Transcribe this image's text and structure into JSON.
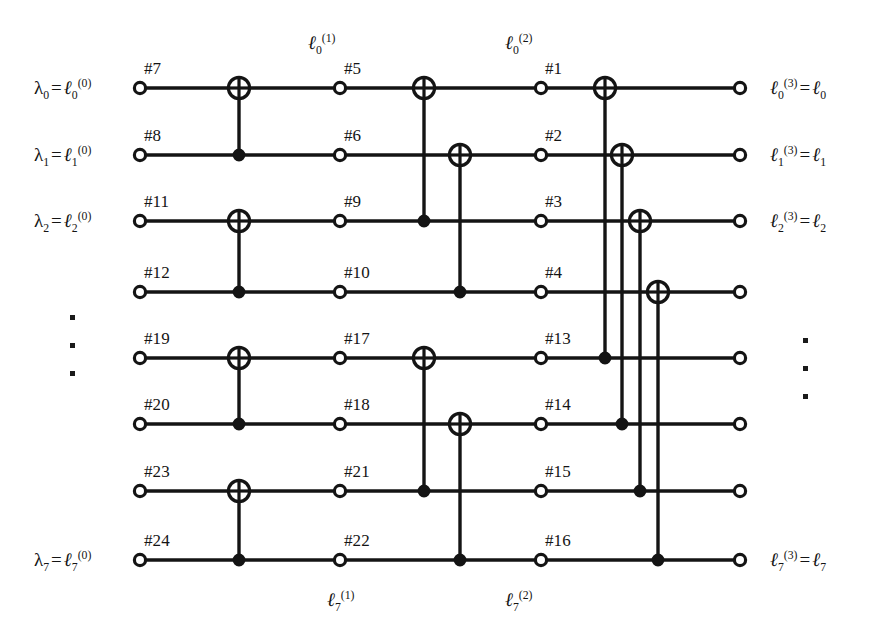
{
  "figure": {
    "width": 876,
    "height": 644,
    "background": "#ffffff",
    "ink": "#141414"
  },
  "geometry": {
    "rows_y": [
      88,
      155,
      221,
      292,
      358,
      424,
      491,
      560
    ],
    "col_x": {
      "input_node": 140,
      "stage1_gate": 239,
      "node_col2": 340,
      "stage2_gate_a": 424,
      "stage2_gate_b": 460,
      "node_col3": 541,
      "stage3_gates": [
        605,
        622,
        640,
        658
      ],
      "output_node": 740
    },
    "wire_start": 140,
    "wire_end": 740
  },
  "wires": [
    {
      "index": 0,
      "input_label": "λ₀ = ℓ₀⁽⁰⁾",
      "output_label": "ℓ₀⁽³⁾ = ℓ₀"
    },
    {
      "index": 1,
      "input_label": "λ₁ = ℓ₁⁽⁰⁾",
      "output_label": "ℓ₁⁽³⁾ = ℓ₁"
    },
    {
      "index": 2,
      "input_label": "λ₂ = ℓ₂⁽⁰⁾",
      "output_label": "ℓ₂⁽³⁾ = ℓ₂"
    },
    {
      "index": 3,
      "input_label": "",
      "output_label": ""
    },
    {
      "index": 4,
      "input_label": "",
      "output_label": ""
    },
    {
      "index": 5,
      "input_label": "",
      "output_label": ""
    },
    {
      "index": 6,
      "input_label": "",
      "output_label": ""
    },
    {
      "index": 7,
      "input_label": "λ₇ = ℓ₇⁽⁰⁾",
      "output_label": "ℓ₇⁽³⁾ = ℓ₇"
    }
  ],
  "node_labels": {
    "column_1": [
      "#7",
      "#8",
      "#11",
      "#12",
      "#19",
      "#20",
      "#23",
      "#24"
    ],
    "column_2": [
      "#5",
      "#6",
      "#9",
      "#10",
      "#17",
      "#18",
      "#21",
      "#22"
    ],
    "column_3": [
      "#1",
      "#2",
      "#3",
      "#4",
      "#13",
      "#14",
      "#15",
      "#16"
    ]
  },
  "stage_labels": {
    "top_stage1": {
      "base": "ℓ",
      "sub": "0",
      "sup": "(1)",
      "text": "ℓ₀⁽¹⁾"
    },
    "top_stage2": {
      "base": "ℓ",
      "sub": "0",
      "sup": "(2)",
      "text": "ℓ₀⁽²⁾"
    },
    "bottom_stage1": {
      "base": "ℓ",
      "sub": "7",
      "sup": "(1)",
      "text": "ℓ₇⁽¹⁾"
    },
    "bottom_stage2": {
      "base": "ℓ",
      "sub": "7",
      "sup": "(2)",
      "text": "ℓ₇⁽²⁾"
    }
  },
  "gates": [
    {
      "stage": 1,
      "x": 239,
      "target_row": 0,
      "control_row": 1
    },
    {
      "stage": 1,
      "x": 239,
      "target_row": 2,
      "control_row": 3
    },
    {
      "stage": 1,
      "x": 239,
      "target_row": 4,
      "control_row": 5
    },
    {
      "stage": 1,
      "x": 239,
      "target_row": 6,
      "control_row": 7
    },
    {
      "stage": 2,
      "x": 424,
      "target_row": 0,
      "control_row": 2
    },
    {
      "stage": 2,
      "x": 460,
      "target_row": 1,
      "control_row": 3
    },
    {
      "stage": 2,
      "x": 424,
      "target_row": 4,
      "control_row": 6
    },
    {
      "stage": 2,
      "x": 460,
      "target_row": 5,
      "control_row": 7
    },
    {
      "stage": 3,
      "x": 605,
      "target_row": 0,
      "control_row": 4
    },
    {
      "stage": 3,
      "x": 622,
      "target_row": 1,
      "control_row": 5
    },
    {
      "stage": 3,
      "x": 640,
      "target_row": 2,
      "control_row": 6
    },
    {
      "stage": 3,
      "x": 658,
      "target_row": 3,
      "control_row": 7
    }
  ],
  "ellipses": {
    "left": {
      "x": 70,
      "y_start": 315,
      "count": 3,
      "dot_size": 5
    },
    "right": {
      "x": 803,
      "y_start": 338,
      "count": 3,
      "dot_size": 5
    }
  }
}
